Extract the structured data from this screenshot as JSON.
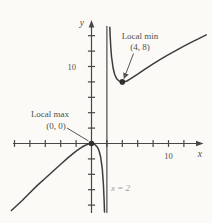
{
  "figure": {
    "background": "#fbfaf7",
    "labels": {
      "y_axis": "y",
      "x_axis": "x",
      "x_tick_10": "10",
      "y_tick_10": "10",
      "local_min_title": "Local min",
      "local_min_coords": "(4, 8)",
      "local_max_title": "Local max",
      "local_max_coords": "(0, 0)",
      "asymptote": "x = 2"
    },
    "colors": {
      "curve": "#3d3d3d",
      "axis": "#474747",
      "text": "#4f4f4f",
      "muted_text": "#9e9e9e",
      "point": "#2f2f2f",
      "leader": "#555555"
    }
  },
  "chart_data": {
    "type": "line",
    "title": "",
    "xlabel": "x",
    "ylabel": "y",
    "xlim": [
      -10.5,
      15
    ],
    "ylim": [
      -9,
      16
    ],
    "grid": false,
    "legend": false,
    "x_tick_step": 2,
    "y_tick_step": 2,
    "x_ticks_range": [
      -10,
      12
    ],
    "y_ticks_range": [
      -8,
      14
    ],
    "labeled_ticks": {
      "x": [
        10
      ],
      "y": [
        10
      ]
    },
    "vertical_asymptote": {
      "x": 2,
      "label": "x = 2"
    },
    "critical_points": [
      {
        "type": "local_max",
        "x": 0,
        "y": 0,
        "label": "Local max",
        "coords_label": "(0, 0)"
      },
      {
        "type": "local_min",
        "x": 4,
        "y": 8,
        "label": "Local min",
        "coords_label": "(4, 8)"
      }
    ],
    "series": [
      {
        "name": "branch_left_of_asymptote",
        "points": [
          [
            -10.4,
            -8.7
          ],
          [
            -9,
            -7.4
          ],
          [
            -8,
            -6.4
          ],
          [
            -7,
            -5.4
          ],
          [
            -6,
            -4.5
          ],
          [
            -5,
            -3.6
          ],
          [
            -4,
            -2.7
          ],
          [
            -3,
            -1.8
          ],
          [
            -2,
            -1
          ],
          [
            -1.5,
            -0.64
          ],
          [
            -1,
            -0.33
          ],
          [
            -0.5,
            -0.1
          ],
          [
            0,
            0
          ],
          [
            0.4,
            -0.1
          ],
          [
            0.8,
            -0.53
          ],
          [
            1,
            -1
          ],
          [
            1.2,
            -1.8
          ],
          [
            1.4,
            -3.3
          ],
          [
            1.55,
            -5.3
          ],
          [
            1.65,
            -7.6
          ],
          [
            1.69,
            -8.9
          ]
        ]
      },
      {
        "name": "branch_right_of_asymptote",
        "points": [
          [
            2.38,
            15.1
          ],
          [
            2.42,
            14.1
          ],
          [
            2.5,
            12.5
          ],
          [
            2.6,
            11.3
          ],
          [
            2.8,
            9.8
          ],
          [
            3,
            9
          ],
          [
            3.25,
            8.45
          ],
          [
            3.5,
            8.17
          ],
          [
            3.75,
            8.04
          ],
          [
            4,
            8
          ],
          [
            4.3,
            8.03
          ],
          [
            4.6,
            8.12
          ],
          [
            5,
            8.35
          ],
          [
            6,
            9
          ],
          [
            7,
            9.7
          ],
          [
            8,
            10.35
          ],
          [
            9,
            10.95
          ],
          [
            10,
            11.55
          ],
          [
            11,
            12.1
          ],
          [
            12,
            12.65
          ],
          [
            13,
            13.15
          ],
          [
            14,
            13.65
          ],
          [
            14.9,
            14.1
          ]
        ]
      }
    ]
  }
}
